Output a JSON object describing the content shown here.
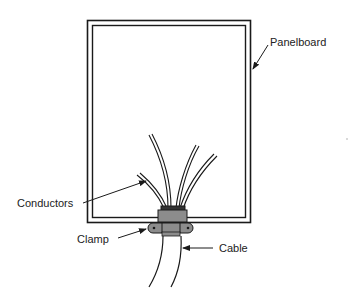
{
  "diagram": {
    "type": "technical-illustration",
    "colors": {
      "line": "#1a1a1a",
      "fill_clamp": "#8c8c8c",
      "fill_dark": "#333333",
      "background": "#ffffff",
      "text": "#222222"
    },
    "labels": {
      "panelboard": "Panelboard",
      "conductors": "Conductors",
      "clamp": "Clamp",
      "cable": "Cable"
    },
    "components": [
      {
        "id": "panelboard",
        "label": "Panelboard",
        "description": "Rectangular enclosure drawn with a double-line border"
      },
      {
        "id": "conductors",
        "label": "Conductors",
        "count": 4,
        "description": "Four insulated conductors fanning upward out of the cable inside the enclosure"
      },
      {
        "id": "clamp",
        "label": "Clamp",
        "description": "Cable clamp/connector at the bottom of the enclosure with two screws"
      },
      {
        "id": "cable",
        "label": "Cable",
        "description": "Cable entering from below through the clamp"
      }
    ]
  }
}
